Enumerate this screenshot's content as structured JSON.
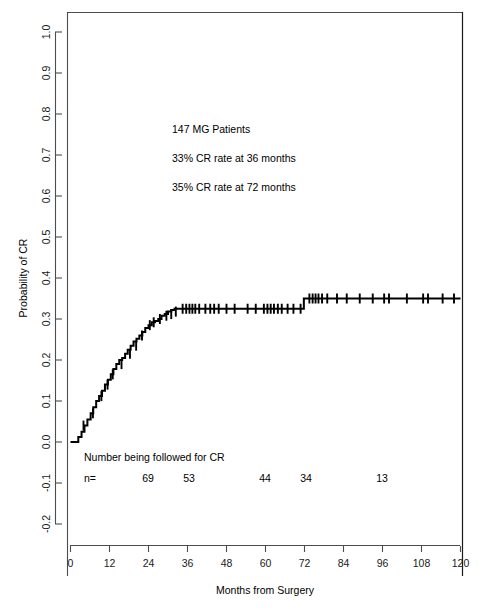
{
  "chart_data": {
    "type": "line",
    "title": "",
    "xlabel": "Months from Surgery",
    "ylabel": "Probability of CR",
    "xlim": [
      0,
      120
    ],
    "ylim": [
      -0.2,
      1.0
    ],
    "xticks": [
      0,
      12,
      24,
      36,
      48,
      60,
      72,
      84,
      96,
      108,
      120
    ],
    "xticklabels": [
      "0",
      "12",
      "24",
      "36",
      "48",
      "60",
      "72",
      "84",
      "96",
      "108",
      "120"
    ],
    "yticks": [
      -0.2,
      -0.1,
      0.0,
      0.1,
      0.2,
      0.3,
      0.4,
      0.5,
      0.6,
      0.7,
      0.8,
      0.9,
      1.0
    ],
    "yticklabels": [
      "-0.2",
      "-0.1",
      "0.0",
      "0.1",
      "0.2",
      "0.3",
      "0.4",
      "0.5",
      "0.6",
      "0.7",
      "0.8",
      "0.9",
      "1.0"
    ],
    "grid": false,
    "legend": false,
    "series": [
      {
        "name": "Cumulative probability of CR",
        "step": "post",
        "x": [
          0,
          1.2,
          2.4,
          3.4,
          4.3,
          5.2,
          6.2,
          7.0,
          7.9,
          8.8,
          9.7,
          10.6,
          11.5,
          12.4,
          13.2,
          14.1,
          15.0,
          15.9,
          16.8,
          17.6,
          18.5,
          19.4,
          20.3,
          21.2,
          22.1,
          23.0,
          24.0,
          25.0,
          26.0,
          27.0,
          28.0,
          29.0,
          30.0,
          31.0,
          32.0,
          33.2,
          71.8,
          120
        ],
        "y": [
          0.0,
          0.0,
          0.012,
          0.025,
          0.04,
          0.055,
          0.07,
          0.085,
          0.1,
          0.112,
          0.125,
          0.14,
          0.152,
          0.165,
          0.178,
          0.19,
          0.2,
          0.205,
          0.215,
          0.225,
          0.235,
          0.245,
          0.252,
          0.26,
          0.268,
          0.278,
          0.285,
          0.292,
          0.295,
          0.3,
          0.308,
          0.312,
          0.318,
          0.322,
          0.325,
          0.325,
          0.35,
          0.35
        ]
      }
    ],
    "censor_marks": {
      "description": "tick marks indicating censored observations along the curve",
      "points": [
        {
          "x": 4.0,
          "y": 0.04
        },
        {
          "x": 6.9,
          "y": 0.07
        },
        {
          "x": 9.5,
          "y": 0.112
        },
        {
          "x": 11.4,
          "y": 0.14
        },
        {
          "x": 13.0,
          "y": 0.165
        },
        {
          "x": 15.7,
          "y": 0.19
        },
        {
          "x": 18.3,
          "y": 0.215
        },
        {
          "x": 20.2,
          "y": 0.235
        },
        {
          "x": 22.0,
          "y": 0.26
        },
        {
          "x": 24.4,
          "y": 0.285
        },
        {
          "x": 25.6,
          "y": 0.292
        },
        {
          "x": 27.5,
          "y": 0.3
        },
        {
          "x": 29.5,
          "y": 0.308
        },
        {
          "x": 31.0,
          "y": 0.312
        },
        {
          "x": 32.4,
          "y": 0.318
        },
        {
          "x": 34.5,
          "y": 0.325
        },
        {
          "x": 35.6,
          "y": 0.325
        },
        {
          "x": 36.6,
          "y": 0.325
        },
        {
          "x": 37.5,
          "y": 0.325
        },
        {
          "x": 38.4,
          "y": 0.325
        },
        {
          "x": 39.6,
          "y": 0.325
        },
        {
          "x": 41.5,
          "y": 0.325
        },
        {
          "x": 43.0,
          "y": 0.325
        },
        {
          "x": 44.2,
          "y": 0.325
        },
        {
          "x": 45.6,
          "y": 0.325
        },
        {
          "x": 48.0,
          "y": 0.325
        },
        {
          "x": 50.5,
          "y": 0.325
        },
        {
          "x": 54.5,
          "y": 0.325
        },
        {
          "x": 57.0,
          "y": 0.325
        },
        {
          "x": 59.5,
          "y": 0.325
        },
        {
          "x": 60.6,
          "y": 0.325
        },
        {
          "x": 61.6,
          "y": 0.325
        },
        {
          "x": 62.6,
          "y": 0.325
        },
        {
          "x": 63.8,
          "y": 0.325
        },
        {
          "x": 65.0,
          "y": 0.325
        },
        {
          "x": 66.8,
          "y": 0.325
        },
        {
          "x": 68.6,
          "y": 0.325
        },
        {
          "x": 70.8,
          "y": 0.325
        },
        {
          "x": 73.5,
          "y": 0.35
        },
        {
          "x": 74.5,
          "y": 0.35
        },
        {
          "x": 75.4,
          "y": 0.35
        },
        {
          "x": 76.3,
          "y": 0.35
        },
        {
          "x": 77.4,
          "y": 0.35
        },
        {
          "x": 79.0,
          "y": 0.35
        },
        {
          "x": 82.0,
          "y": 0.35
        },
        {
          "x": 85.0,
          "y": 0.35
        },
        {
          "x": 89.0,
          "y": 0.35
        },
        {
          "x": 93.0,
          "y": 0.35
        },
        {
          "x": 96.5,
          "y": 0.35
        },
        {
          "x": 98.0,
          "y": 0.35
        },
        {
          "x": 103.5,
          "y": 0.35
        },
        {
          "x": 108.5,
          "y": 0.35
        },
        {
          "x": 110.0,
          "y": 0.35
        },
        {
          "x": 114.5,
          "y": 0.35
        },
        {
          "x": 118.0,
          "y": 0.35
        }
      ]
    },
    "annotations": [
      {
        "text": "147  MG Patients",
        "x": 26,
        "y": 0.755
      },
      {
        "text": "33% CR rate at 36 months",
        "x": 26,
        "y": 0.685
      },
      {
        "text": "35% CR rate at 72 months",
        "x": 26,
        "y": 0.615
      }
    ],
    "risk_table": {
      "heading": "Number being followed for CR",
      "row_label": "n=",
      "times": [
        12,
        24,
        48,
        60,
        84
      ],
      "counts": [
        "69",
        "53",
        "44",
        "34",
        "13"
      ]
    }
  }
}
